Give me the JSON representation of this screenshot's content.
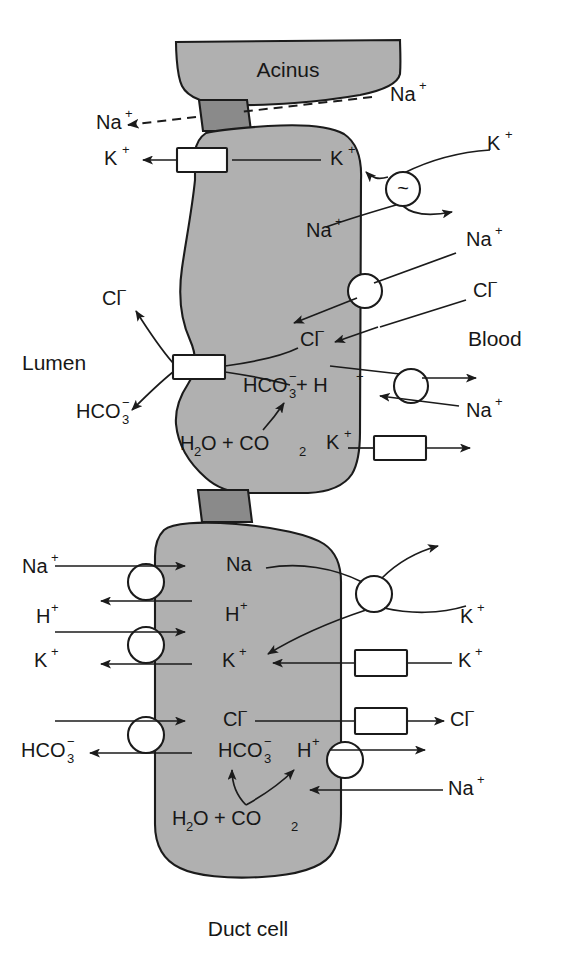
{
  "figure": {
    "caption": "Duct cell",
    "acinus_label": "Acinus",
    "lumen_label": "Lumen",
    "blood_label": "Blood",
    "colors": {
      "cell_fill": "#b0b0b0",
      "junction_fill": "#8a8a8a",
      "outline": "#1b1b1b",
      "transporter_fill": "#ffffff",
      "background": "#ffffff",
      "text": "#171717"
    }
  },
  "acinar_cell": {
    "name": "Acinar cell",
    "labels": {
      "tj_na_lumen": {
        "base": "Na",
        "sup": "+"
      },
      "tj_na_blood": {
        "base": "Na",
        "sup": "+"
      },
      "k_lumen": {
        "base": "K",
        "sup": "+"
      },
      "k_intra": {
        "base": "K",
        "sup": "+"
      },
      "k_blood": {
        "base": "K",
        "sup": "+"
      },
      "na_intra": {
        "base": "Na",
        "sup": "+"
      },
      "na_blood": {
        "base": "Na",
        "sup": "+"
      },
      "cl_lumen": {
        "base": "Cl",
        "sup": "−"
      },
      "cl_intra": {
        "base": "Cl",
        "sup": "−"
      },
      "cl_blood": {
        "base": "Cl",
        "sup": "−"
      },
      "hco3_lumen": {
        "base": "HCO",
        "sub": "3",
        "sup": "−"
      },
      "hco3_h_intra": {
        "base": "HCO",
        "sub": "3",
        "sup": "−",
        "tail": " + H",
        "tail_sup": "+"
      },
      "na_exchange_blood": {
        "base": "Na",
        "sup": "+"
      },
      "k_channel_blood": {
        "base": "K",
        "sup": "+"
      },
      "water_co2": {
        "base": "H",
        "sub": "2",
        "mid": "O + CO",
        "sub2": "2"
      }
    },
    "transporters": [
      {
        "id": "k-channel-apical",
        "shape": "rect",
        "name": "Apical K channel"
      },
      {
        "id": "cl-hco3-channel-apical",
        "shape": "rect",
        "name": "Apical Cl/HCO3 channel"
      },
      {
        "id": "na-k-atpase-basolateral",
        "shape": "circle",
        "glyph": "~",
        "name": "Na/K ATPase"
      },
      {
        "id": "nkcc-basolateral",
        "shape": "circle",
        "name": "Na-Cl cotransporter"
      },
      {
        "id": "na-h-exchanger-basolateral",
        "shape": "circle",
        "name": "Na/H exchanger"
      },
      {
        "id": "k-channel-basolateral",
        "shape": "rect",
        "name": "Basolateral K channel"
      }
    ]
  },
  "duct_cell": {
    "name": "Duct cell",
    "labels": {
      "na_lumen": {
        "base": "Na",
        "sup": "+"
      },
      "na_intra": {
        "base": "Na"
      },
      "h_lumen": {
        "base": "H",
        "sup": "+"
      },
      "h_intra": {
        "base": "H",
        "sup": "+"
      },
      "k_lumen": {
        "base": "K",
        "sup": "+"
      },
      "k_intra": {
        "base": "K",
        "sup": "+"
      },
      "k_blood_pump": {
        "base": "K",
        "sup": "+"
      },
      "k_blood_channel": {
        "base": "K",
        "sup": "+"
      },
      "cl_intra": {
        "base": "Cl",
        "sup": "−"
      },
      "cl_blood": {
        "base": "Cl",
        "sup": "−"
      },
      "hco3_lumen": {
        "base": "HCO",
        "sub": "3",
        "sup": "−"
      },
      "hco3_intra": {
        "base": "HCO",
        "sub": "3",
        "sup": "−"
      },
      "h_basolateral": {
        "base": "H",
        "sup": "+"
      },
      "na_basolateral": {
        "base": "Na",
        "sup": "+"
      },
      "water_co2": {
        "base": "H",
        "sub": "2",
        "mid": "O + CO",
        "sub2": "2"
      }
    },
    "transporters": [
      {
        "id": "na-h-exchanger-apical",
        "shape": "circle",
        "name": "Apical Na/H exchanger"
      },
      {
        "id": "h-k-exchanger-apical",
        "shape": "circle",
        "name": "Apical H/K exchanger"
      },
      {
        "id": "cl-hco3-exchanger-apical",
        "shape": "circle",
        "name": "Apical Cl/HCO3 exchanger"
      },
      {
        "id": "na-k-atpase-basolateral",
        "shape": "circle",
        "glyph": "~",
        "name": "Na/K ATPase"
      },
      {
        "id": "k-channel-basolateral",
        "shape": "rect",
        "name": "Basolateral K channel"
      },
      {
        "id": "cl-channel-basolateral",
        "shape": "rect",
        "name": "Basolateral Cl channel"
      },
      {
        "id": "na-h-exchanger-basolateral",
        "shape": "circle",
        "name": "Basolateral Na/H exchanger"
      }
    ]
  }
}
